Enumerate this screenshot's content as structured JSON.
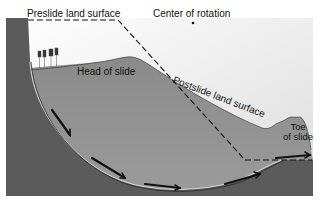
{
  "figure": {
    "labels": {
      "preslide_surface": "Preslide land surface",
      "center_of_rotation": "Center of rotation",
      "head_of_slide": "Head of slide",
      "postslide_surface": "Postslide land surface",
      "toe_line1": "Toe",
      "toe_line2": "of slide"
    },
    "colors": {
      "sky_top": "#ffffff",
      "sky_bottom": "#e6e6e6",
      "bedrock": "#5a5a5a",
      "slide_mass": "#8f8f8f",
      "lines": "#1a1a1a"
    },
    "elements": {
      "slip_arrows_count": 6,
      "trees_count": 4
    }
  }
}
